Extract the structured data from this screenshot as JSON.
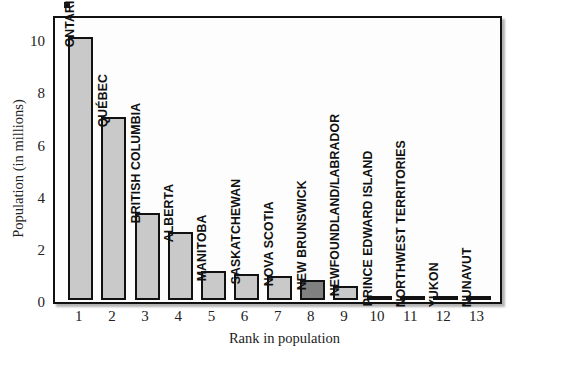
{
  "chart_data": {
    "type": "bar",
    "title": "",
    "xlabel": "Rank in population",
    "ylabel": "Population (in millions)",
    "ylim": [
      0,
      10.85
    ],
    "yticks": [
      0,
      2,
      4,
      6,
      8,
      10
    ],
    "ytick_labels": [
      "0",
      "2",
      "4",
      "6",
      "8",
      "10"
    ],
    "xticks": [
      1,
      2,
      3,
      4,
      5,
      6,
      7,
      8,
      9,
      10,
      11,
      12,
      13
    ],
    "xtick_labels": [
      "1",
      "2",
      "3",
      "4",
      "5",
      "6",
      "7",
      "8",
      "9",
      "10",
      "11",
      "12",
      "13"
    ],
    "categories": [
      "ONTARIO",
      "QUÉBEC",
      "BRITISH COLUMBIA",
      "ALBERTA",
      "MANITOBA",
      "SASKATCHEWAN",
      "NOVA SCOTIA",
      "NEW BRUNSWICK",
      "NEWFOUNDLAND/LABRADOR",
      "PRINCE EDWARD ISLAND",
      "NORTHWEST TERRITORIES",
      "YUKON",
      "NUNAVUT"
    ],
    "values": [
      10.1,
      7.0,
      3.35,
      2.6,
      1.12,
      1.0,
      0.92,
      0.75,
      0.53,
      0.14,
      0.04,
      0.03,
      0.03
    ],
    "highlight_index": 7,
    "grid": false,
    "legend": false
  },
  "colors": {
    "bar_fill": "#c9c9c9",
    "bar_highlight_fill": "#808080",
    "bar_edge": "#111111",
    "frame": "#111111",
    "background": "#ffffff",
    "text": "#222222"
  },
  "axis": {
    "y_title": "Population (in millions)",
    "x_title": "Rank in population"
  }
}
